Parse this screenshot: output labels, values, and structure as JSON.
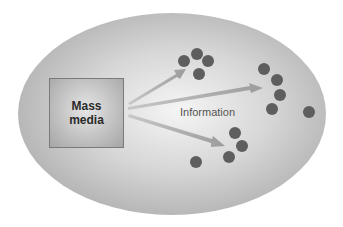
{
  "diagram": {
    "source_label": "Mass\nmedia",
    "source_lines": [
      "Mass",
      "media"
    ],
    "arrow_label": "Information",
    "colors": {
      "background_ellipse_center": "#f2f2f2",
      "background_ellipse_edge": "#b5b5b5",
      "dot": "#5e5e5e",
      "arrow": "#a8a8a8"
    },
    "arrows": [
      {
        "from": [
          128,
          102
        ],
        "to": [
          186,
          69
        ]
      },
      {
        "from": [
          128,
          108
        ],
        "to": [
          263,
          88
        ]
      },
      {
        "from": [
          128,
          115
        ],
        "to": [
          225,
          146
        ]
      }
    ],
    "dots": [
      [
        184,
        61
      ],
      [
        197,
        54
      ],
      [
        208,
        61
      ],
      [
        199,
        74
      ],
      [
        264,
        69
      ],
      [
        277,
        80
      ],
      [
        280,
        95
      ],
      [
        272,
        109
      ],
      [
        309,
        112
      ],
      [
        235,
        133
      ],
      [
        242,
        146
      ],
      [
        229,
        157
      ],
      [
        196,
        162
      ]
    ]
  }
}
